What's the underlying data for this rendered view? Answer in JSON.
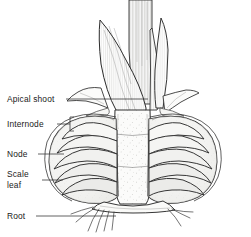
{
  "figure": {
    "style": "pen-and-ink botanical line drawing",
    "background_color": "#ffffff",
    "ink_color": "#2b2b2b",
    "fill_color": "#f2f2f0"
  },
  "labels": [
    {
      "id": "apical-shoot",
      "text": "Apical shoot",
      "lines": [
        "Apical shoot"
      ],
      "x": 7,
      "y": 102,
      "leader": {
        "type": "line",
        "x1": 66,
        "y1": 99,
        "x2": 148,
        "y2": 99
      }
    },
    {
      "id": "internode",
      "text": "Internode",
      "lines": [
        "Internode"
      ],
      "x": 7,
      "y": 127,
      "leader": {
        "type": "bracket",
        "x1": 57,
        "y1": 124,
        "x2": 72,
        "y2": 124
      }
    },
    {
      "id": "node",
      "text": "Node",
      "lines": [
        "Node"
      ],
      "x": 7,
      "y": 157,
      "leader": {
        "type": "line",
        "x1": 38,
        "y1": 154,
        "x2": 64,
        "y2": 154
      }
    },
    {
      "id": "scale-leaf",
      "text": "Scale leaf",
      "lines": [
        "Scale",
        "leaf"
      ],
      "x": 7,
      "y": 177,
      "leader": {
        "type": "line",
        "x1": 42,
        "y1": 180,
        "x2": 63,
        "y2": 180
      }
    },
    {
      "id": "root",
      "text": "Root",
      "lines": [
        "Root"
      ],
      "x": 7,
      "y": 219,
      "leader": {
        "type": "line",
        "x1": 36,
        "y1": 216,
        "x2": 116,
        "y2": 216
      }
    }
  ],
  "parts": [
    {
      "id": "apical-shoot",
      "name": "Apical shoot",
      "description": "Pointed young leaves emerging from the top of the bulb"
    },
    {
      "id": "internode",
      "name": "Internode",
      "description": "Short stem segment between nodes at the top of the basal plate"
    },
    {
      "id": "node",
      "name": "Node",
      "description": "Point on the stem where a scale leaf is attached"
    },
    {
      "id": "scale-leaf",
      "name": "Scale leaf",
      "description": "Fleshy storage leaves forming the layered body of the bulb"
    },
    {
      "id": "root",
      "name": "Root",
      "description": "Fine adventitious roots from the basal plate"
    }
  ]
}
